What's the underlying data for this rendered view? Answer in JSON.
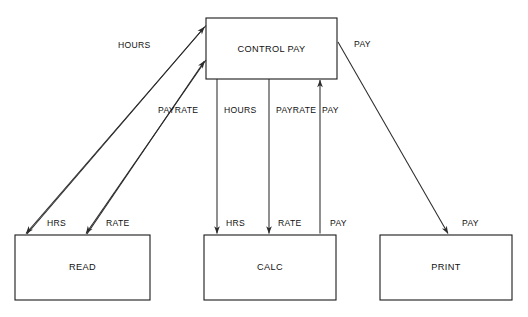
{
  "diagram": {
    "type": "structure-chart",
    "colors": {
      "background": "#ffffff",
      "box_stroke": "#1a1a1a",
      "box_fill": "#ffffff",
      "line": "#2b2b2b",
      "text": "#111111"
    },
    "modules": [
      {
        "id": "control-pay",
        "label": "CONTROL PAY",
        "x": 206,
        "y": 18,
        "width": 131,
        "height": 61
      },
      {
        "id": "read",
        "label": "READ",
        "x": 15,
        "y": 235,
        "width": 135,
        "height": 65
      },
      {
        "id": "calc",
        "label": "CALC",
        "x": 204,
        "y": 235,
        "width": 132,
        "height": 65
      },
      {
        "id": "print",
        "label": "PRINT",
        "x": 380,
        "y": 235,
        "width": 132,
        "height": 65
      }
    ],
    "couples": [
      {
        "id": "hours-up",
        "label": "HOURS",
        "from": "read",
        "to": "control-pay",
        "direction": "up",
        "label_x": 118,
        "label_y": 46
      },
      {
        "id": "payrate-up",
        "label": "PAYRATE",
        "from": "read",
        "to": "control-pay",
        "direction": "up",
        "label_x": 158,
        "label_y": 111
      },
      {
        "id": "hours-down",
        "label": "HOURS",
        "from": "control-pay",
        "to": "calc",
        "direction": "down",
        "label_x": 224,
        "label_y": 111
      },
      {
        "id": "payrate-down",
        "label": "PAYRATE",
        "from": "control-pay",
        "to": "calc",
        "direction": "down",
        "label_x": 276,
        "label_y": 111
      },
      {
        "id": "pay-up-calc",
        "label": "PAY",
        "from": "calc",
        "to": "control-pay",
        "direction": "up",
        "label_x": 322,
        "label_y": 111
      },
      {
        "id": "pay-down-print",
        "label": "PAY",
        "from": "control-pay",
        "to": "print",
        "direction": "down",
        "label_x": 354,
        "label_y": 45
      },
      {
        "id": "hrs-read",
        "label": "HRS",
        "from": "control-pay",
        "to": "read",
        "direction": "down",
        "label_x": 47,
        "label_y": 224
      },
      {
        "id": "rate-read",
        "label": "RATE",
        "from": "control-pay",
        "to": "read",
        "direction": "down",
        "label_x": 106,
        "label_y": 224
      },
      {
        "id": "hrs-calc",
        "label": "HRS",
        "from": "control-pay",
        "to": "calc",
        "direction": "down",
        "label_x": 226,
        "label_y": 224
      },
      {
        "id": "rate-calc",
        "label": "RATE",
        "from": "control-pay",
        "to": "calc",
        "direction": "down",
        "label_x": 278,
        "label_y": 224
      },
      {
        "id": "pay-calc",
        "label": "PAY",
        "from": "calc",
        "to": "control-pay",
        "direction": "up",
        "label_x": 330,
        "label_y": 224
      },
      {
        "id": "pay-print",
        "label": "PAY",
        "from": "control-pay",
        "to": "print",
        "direction": "down",
        "label_x": 462,
        "label_y": 224
      }
    ]
  }
}
